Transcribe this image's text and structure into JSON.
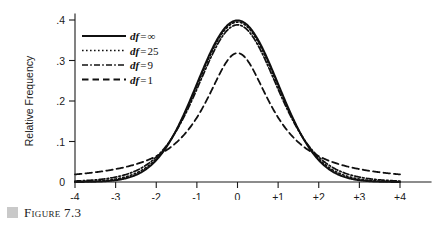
{
  "figure": {
    "caption_label": "Figure 7.3",
    "caption_marker_color": "#c9c9c9"
  },
  "chart_data": {
    "type": "line",
    "title": "",
    "xlabel": "",
    "ylabel": "Relative Frequency",
    "xlim": [
      -4,
      4
    ],
    "ylim": [
      0,
      0.44
    ],
    "grid": false,
    "legend_position": "upper-left-inside",
    "x_ticks": [
      -4,
      -3,
      -2,
      -1,
      0,
      1,
      2,
      3,
      4
    ],
    "x_tick_labels": [
      "-4",
      "-3",
      "-2",
      "-1",
      "0",
      "+1",
      "+2",
      "+3",
      "+4"
    ],
    "y_ticks": [
      0,
      0.1,
      0.2,
      0.3,
      0.4
    ],
    "y_tick_labels": [
      "0",
      ".1",
      ".2",
      ".3",
      ".4"
    ],
    "series": [
      {
        "name": "df = ∞",
        "legend_prefix": "df",
        "legend_equals": "=",
        "legend_value": "∞",
        "df": null,
        "style": "solid",
        "dash": "none",
        "width": 2.0,
        "peak": 0.399,
        "x": [
          -4,
          -3.5,
          -3,
          -2.5,
          -2,
          -1.5,
          -1,
          -0.5,
          0,
          0.5,
          1,
          1.5,
          2,
          2.5,
          3,
          3.5,
          4
        ],
        "values": [
          0.0001,
          0.0009,
          0.0044,
          0.0175,
          0.054,
          0.1295,
          0.242,
          0.3521,
          0.3989,
          0.3521,
          0.242,
          0.1295,
          0.054,
          0.0175,
          0.0044,
          0.0009,
          0.0001
        ]
      },
      {
        "name": "df = 25",
        "legend_prefix": "df",
        "legend_equals": "=",
        "legend_value": "25",
        "df": 25,
        "style": "dotted",
        "dash": "1.6 2.4",
        "width": 1.7,
        "peak": 0.3956,
        "x": [
          -4,
          -3.5,
          -3,
          -2.5,
          -2,
          -1.5,
          -1,
          -0.5,
          0,
          0.5,
          1,
          1.5,
          2,
          2.5,
          3,
          3.5,
          4
        ],
        "values": [
          0.0011,
          0.0031,
          0.0087,
          0.0235,
          0.0578,
          0.1284,
          0.2375,
          0.3472,
          0.3956,
          0.3472,
          0.2375,
          0.1284,
          0.0578,
          0.0235,
          0.0087,
          0.0031,
          0.0011
        ]
      },
      {
        "name": "df = 9",
        "legend_prefix": "df",
        "legend_equals": "=",
        "legend_value": "9",
        "df": 9,
        "style": "dashdot",
        "dash": "6 2.2 1.6 2.2",
        "width": 1.7,
        "peak": 0.388,
        "x": [
          -4,
          -3.5,
          -3,
          -2.5,
          -2,
          -1.5,
          -1,
          -0.5,
          0,
          0.5,
          1,
          1.5,
          2,
          2.5,
          3,
          3.5,
          4
        ],
        "values": [
          0.0027,
          0.0058,
          0.0133,
          0.0307,
          0.0659,
          0.1271,
          0.2275,
          0.3373,
          0.388,
          0.3373,
          0.2275,
          0.1271,
          0.0659,
          0.0307,
          0.0133,
          0.0058,
          0.0027
        ]
      },
      {
        "name": "df = 1",
        "legend_prefix": "df",
        "legend_equals": "=",
        "legend_value": "1",
        "df": 1,
        "style": "dashed",
        "dash": "6.5 4",
        "width": 1.8,
        "peak": 0.3183,
        "x": [
          -4,
          -3.5,
          -3,
          -2.5,
          -2,
          -1.5,
          -1,
          -0.5,
          0,
          0.5,
          1,
          1.5,
          2,
          2.5,
          3,
          3.5,
          4
        ],
        "values": [
          0.0187,
          0.0241,
          0.0318,
          0.0439,
          0.0637,
          0.0979,
          0.1592,
          0.2546,
          0.3183,
          0.2546,
          0.1592,
          0.0979,
          0.0637,
          0.0439,
          0.0318,
          0.0241,
          0.0187
        ]
      }
    ]
  }
}
